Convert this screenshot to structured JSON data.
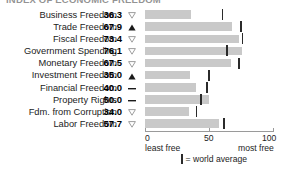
{
  "title_strip": "INDEX OF ECONOMIC FREEDOM",
  "axis": {
    "ticks": [
      {
        "value": 0,
        "label": "0"
      },
      {
        "value": 50,
        "label": "50"
      },
      {
        "value": 100,
        "label": "100"
      }
    ],
    "least_free_label": "least free",
    "most_free_label": "most free",
    "min": 0,
    "max": 100
  },
  "legend": {
    "marker_glyph": "|",
    "text": "= world average"
  },
  "icons": {
    "down_triangle": "triangle-down-outline-icon",
    "up_triangle": "triangle-up-filled-icon",
    "dash": "dash-icon"
  },
  "chart_data": {
    "type": "bar",
    "title": "INDEX OF ECONOMIC FREEDOM",
    "xlabel": "",
    "ylabel": "",
    "xlim": [
      0,
      100
    ],
    "grid": false,
    "orientation": "horizontal",
    "legend_position": "bottom",
    "categories": [
      "Business Freedom",
      "Trade Freedom",
      "Fiscal Freedom",
      "Government Spending",
      "Monetary Freedom",
      "Investment Freedom",
      "Financial Freedom",
      "Property Rights",
      "Fdm. from Corruption",
      "Labor Freedom"
    ],
    "values": [
      36.3,
      67.9,
      73.4,
      76.1,
      67.5,
      35.0,
      40.0,
      50.0,
      34.0,
      57.7
    ],
    "value_labels": [
      "36.3",
      "67.9",
      "73.4",
      "76.1",
      "67.5",
      "35.0",
      "40.0",
      "50.0",
      "34.0",
      "57.7"
    ],
    "trends": [
      "down",
      "up",
      "down",
      "down",
      "down",
      "up",
      "flat",
      "flat",
      "down",
      "down"
    ],
    "series": [
      {
        "name": "Country score",
        "values": [
          36.3,
          67.9,
          73.4,
          76.1,
          67.5,
          35.0,
          40.0,
          50.0,
          34.0,
          57.7
        ]
      },
      {
        "name": "world average",
        "values": [
          60.4,
          74.8,
          76.3,
          63.9,
          73.4,
          50.2,
          48.5,
          43.6,
          40.3,
          61.5
        ]
      }
    ]
  }
}
